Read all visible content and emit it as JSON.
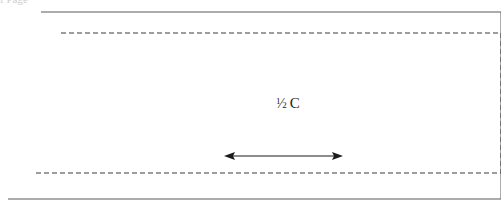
{
  "page": {
    "width": 501,
    "height": 206,
    "background_color": "#ffffff"
  },
  "cropped_header_text": "f Page",
  "figure": {
    "solid_outline": {
      "name": "outer-parallelogram",
      "stroke_color": "#5a5a5a",
      "stroke_width": 1,
      "style": "solid",
      "points": "41,12 501,12 501,199 8,199"
    },
    "dashed_outline": {
      "name": "inner-dashed-parallelogram",
      "stroke_color": "#3a3a3a",
      "stroke_width": 1,
      "style": "dashed",
      "dash_pattern": "5,3",
      "points": "61,33 501,33 501,173 34,173"
    },
    "dimension_arrow": {
      "name": "half-c-dimension-arrow",
      "color": "#1b1b1b",
      "x_start": 224,
      "x_end": 343,
      "y": 156,
      "double_headed": true
    },
    "label": {
      "text": "1/2 C",
      "numerator": "1",
      "slash": "⁄",
      "denominator": "2",
      "unit": "C",
      "x": 283,
      "y": 106,
      "color": "#1b1b1b"
    }
  }
}
